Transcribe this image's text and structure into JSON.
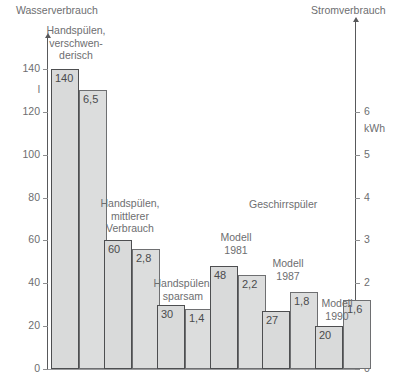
{
  "headers": {
    "left": "Wasserverbrauch",
    "right": "Stromverbrauch"
  },
  "axes": {
    "left": {
      "unit": "l",
      "ticks": [
        "140",
        "120",
        "100",
        "80",
        "60",
        "40",
        "20",
        "0"
      ],
      "min": 0,
      "max": 140
    },
    "right": {
      "unit": "kWh",
      "ticks": [
        "6",
        "5",
        "4",
        "3",
        "2",
        "1",
        "0"
      ],
      "min": 0,
      "max": 7
    }
  },
  "group_title": "Geschirrspüler",
  "chart_data": {
    "type": "bar",
    "xlabel": "",
    "ylabel": "Wasserverbrauch",
    "ylabel2": "Stromverbrauch",
    "ylim": [
      0,
      140
    ],
    "ylim2": [
      0,
      7
    ],
    "yunit": "l",
    "yunit2": "kWh",
    "grid": false,
    "legend": "none",
    "categories": [
      "Handspülen, verschwenderisch",
      "Handspülen, mittlerer Verbrauch",
      "Handspülen, sparsam",
      "Modell 1981",
      "Modell 1987",
      "Modell 1990"
    ],
    "series": [
      {
        "name": "Wasserverbrauch",
        "unit": "l",
        "axis": "left",
        "values": [
          140,
          60,
          30,
          48,
          27,
          20
        ]
      },
      {
        "name": "Stromverbrauch",
        "unit": "kWh",
        "axis": "right",
        "values": [
          6.5,
          2.8,
          1.4,
          2.2,
          1.8,
          1.6
        ]
      }
    ],
    "annotations": [
      "Geschirrspüler"
    ]
  },
  "groups": [
    {
      "label": "Handspülen,\nverschwen-\nderisch",
      "water": "140",
      "power": "6,5"
    },
    {
      "label": "Handspülen,\nmittlerer\nVerbrauch",
      "water": "60",
      "power": "2,8"
    },
    {
      "label": "Handspülen,\nsparsam",
      "water": "30",
      "power": "1,4"
    },
    {
      "label": "Modell\n1981",
      "water": "48",
      "power": "2,2"
    },
    {
      "label": "Modell\n1987",
      "water": "27",
      "power": "1,8"
    },
    {
      "label": "Modell\n1990",
      "water": "20",
      "power": "1,6"
    }
  ]
}
